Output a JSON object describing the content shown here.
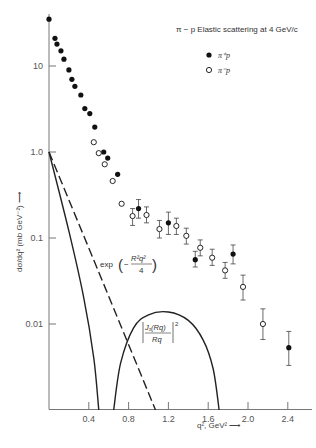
{
  "chart_data": {
    "type": "scatter",
    "title": "π − p Elastic scattering at 4 GeV/c",
    "xlabel": "q², GeV² ⟶",
    "ylabel": "dσ/dq² (mb GeV⁻²) ⟶",
    "xscale": "linear",
    "yscale": "log",
    "xlim": [
      0,
      2.6
    ],
    "ylim": [
      0.001,
      40
    ],
    "x_ticks": [
      0.4,
      0.8,
      1.2,
      1.6,
      2.0,
      2.4
    ],
    "x_tick_labels": [
      "0.4",
      "0.8",
      "1.2",
      "1.6",
      "2.0",
      "2.4"
    ],
    "y_ticks": [
      10,
      1,
      0.1,
      0.01
    ],
    "y_tick_labels": [
      "10",
      "1.0",
      "0.1",
      "0.01"
    ],
    "grid": false,
    "legend_position": "top-right",
    "series": [
      {
        "name": "π⁺p",
        "marker": "filled-circle",
        "color": "#111111",
        "points": [
          {
            "x": 0.0,
            "y": 35
          },
          {
            "x": 0.06,
            "y": 21
          },
          {
            "x": 0.08,
            "y": 18
          },
          {
            "x": 0.12,
            "y": 15
          },
          {
            "x": 0.15,
            "y": 12
          },
          {
            "x": 0.2,
            "y": 9
          },
          {
            "x": 0.23,
            "y": 7
          },
          {
            "x": 0.26,
            "y": 5.8
          },
          {
            "x": 0.32,
            "y": 4.6
          },
          {
            "x": 0.36,
            "y": 3.2
          },
          {
            "x": 0.41,
            "y": 2.8
          },
          {
            "x": 0.46,
            "y": 1.95
          },
          {
            "x": 0.55,
            "y": 1.0
          },
          {
            "x": 0.59,
            "y": 0.85
          },
          {
            "x": 0.69,
            "y": 0.55
          },
          {
            "x": 0.9,
            "y": 0.22,
            "err": [
              0.17,
              0.28
            ]
          },
          {
            "x": 1.2,
            "y": 0.15,
            "err": [
              0.11,
              0.2
            ]
          },
          {
            "x": 1.47,
            "y": 0.056,
            "err": [
              0.046,
              0.07
            ]
          },
          {
            "x": 1.85,
            "y": 0.065,
            "err": [
              0.05,
              0.083
            ]
          },
          {
            "x": 2.41,
            "y": 0.0053,
            "err": [
              0.0033,
              0.0082
            ]
          }
        ]
      },
      {
        "name": "π⁻p",
        "marker": "open-circle",
        "color": "#111111",
        "points": [
          {
            "x": 0.45,
            "y": 1.3
          },
          {
            "x": 0.5,
            "y": 0.97
          },
          {
            "x": 0.56,
            "y": 0.72
          },
          {
            "x": 0.64,
            "y": 0.46
          },
          {
            "x": 0.73,
            "y": 0.25
          },
          {
            "x": 0.84,
            "y": 0.18,
            "err": [
              0.14,
              0.22
            ]
          },
          {
            "x": 0.98,
            "y": 0.185,
            "err": [
              0.15,
              0.23
            ]
          },
          {
            "x": 1.11,
            "y": 0.127,
            "err": [
              0.1,
              0.16
            ]
          },
          {
            "x": 1.28,
            "y": 0.138,
            "err": [
              0.11,
              0.17
            ]
          },
          {
            "x": 1.38,
            "y": 0.106,
            "err": [
              0.085,
              0.13
            ]
          },
          {
            "x": 1.52,
            "y": 0.077,
            "err": [
              0.062,
              0.095
            ]
          },
          {
            "x": 1.64,
            "y": 0.059,
            "err": [
              0.048,
              0.074
            ]
          },
          {
            "x": 1.77,
            "y": 0.042,
            "err": [
              0.034,
              0.052
            ]
          },
          {
            "x": 1.95,
            "y": 0.027,
            "err": [
              0.019,
              0.037
            ]
          },
          {
            "x": 2.15,
            "y": 0.01,
            "err": [
              0.0066,
              0.015
            ]
          }
        ]
      }
    ],
    "curves": [
      {
        "name": "exp(-R²q²/4)",
        "style": "dashed",
        "points": [
          {
            "x": 0.0,
            "y": 1.0
          },
          {
            "x": 0.5,
            "y": 0.04
          },
          {
            "x": 1.07,
            "y": 0.001
          }
        ]
      },
      {
        "name": "|J₁(Rq)/Rq|² (first lobe)",
        "style": "solid",
        "points": [
          {
            "x": 0.0,
            "y": 1.0
          },
          {
            "x": 0.2,
            "y": 0.12
          },
          {
            "x": 0.35,
            "y": 0.02
          },
          {
            "x": 0.45,
            "y": 0.004
          },
          {
            "x": 0.5,
            "y": 0.001
          }
        ]
      },
      {
        "name": "|J₁(Rq)/Rq|² (second lobe)",
        "style": "solid",
        "points": [
          {
            "x": 0.65,
            "y": 0.001
          },
          {
            "x": 0.72,
            "y": 0.0035
          },
          {
            "x": 0.85,
            "y": 0.009
          },
          {
            "x": 1.0,
            "y": 0.0128
          },
          {
            "x": 1.2,
            "y": 0.0138
          },
          {
            "x": 1.4,
            "y": 0.011
          },
          {
            "x": 1.55,
            "y": 0.0065
          },
          {
            "x": 1.65,
            "y": 0.003
          },
          {
            "x": 1.71,
            "y": 0.001
          }
        ]
      }
    ],
    "annotations": [
      {
        "id": "exp",
        "text_prefix": "exp",
        "numerator": "R²q²",
        "denominator": "4",
        "sign": "−",
        "anchor": {
          "x": 0.58,
          "y": 0.055
        }
      },
      {
        "id": "bessel",
        "numerator": "J₁(Rq)",
        "denominator": "Rq",
        "power": "2",
        "anchor": {
          "x": 0.98,
          "y": 0.0075
        }
      }
    ]
  }
}
